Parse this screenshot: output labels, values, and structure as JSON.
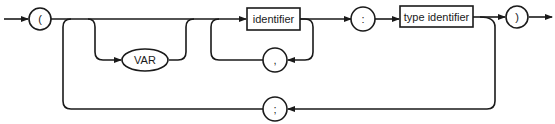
{
  "diagram": {
    "type": "syntax-diagram",
    "colors": {
      "stroke": "#1a1a1a",
      "background": "#ffffff"
    },
    "nodes": {
      "open_paren": {
        "shape": "circle",
        "label": "("
      },
      "var_kw": {
        "shape": "ellipse",
        "label": "VAR"
      },
      "identifier": {
        "shape": "box",
        "label": "identifier"
      },
      "comma": {
        "shape": "circle",
        "label": ","
      },
      "colon": {
        "shape": "circle",
        "label": ":"
      },
      "type_identifier": {
        "shape": "box",
        "label": "type identifier"
      },
      "close_paren": {
        "shape": "circle",
        "label": ")"
      },
      "semicolon": {
        "shape": "circle",
        "label": ";"
      }
    }
  }
}
